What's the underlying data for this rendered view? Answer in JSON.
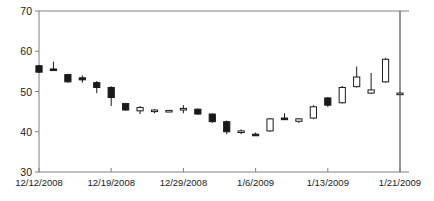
{
  "chart_data": {
    "type": "candlestick",
    "title": "",
    "xlabel": "",
    "ylabel": "",
    "ylim": [
      30,
      70
    ],
    "yticks": [
      30,
      40,
      50,
      60,
      70
    ],
    "ytick_labels": [
      "30",
      "40",
      "50",
      "60",
      "70"
    ],
    "grid": false,
    "legend": null,
    "xtick_labels": [
      "12/12/2008",
      "12/19/2008",
      "12/29/2008",
      "1/6/2009",
      "1/13/2009",
      "1/21/2009"
    ],
    "xtick_indices": [
      0,
      5,
      10,
      15,
      20,
      25
    ],
    "up_color": "#ffffff",
    "down_color": "#1a1a1a",
    "line_color": "#1a1a1a",
    "axis_color": "#808080",
    "candles": [
      {
        "date": "12/12/2008",
        "open": 56.4,
        "high": 56.6,
        "low": 54.6,
        "close": 54.8,
        "dir": "down"
      },
      {
        "date": "12/15/2008",
        "open": 55.6,
        "high": 57.4,
        "low": 55.5,
        "close": 55.5,
        "dir": "down"
      },
      {
        "date": "12/16/2008",
        "open": 54.2,
        "high": 54.4,
        "low": 52.2,
        "close": 52.4,
        "dir": "down"
      },
      {
        "date": "12/17/2008",
        "open": 53.4,
        "high": 54.0,
        "low": 52.2,
        "close": 52.9,
        "dir": "down"
      },
      {
        "date": "12/18/2008",
        "open": 52.2,
        "high": 52.6,
        "low": 49.6,
        "close": 51.0,
        "dir": "down"
      },
      {
        "date": "12/19/2008",
        "open": 51.0,
        "high": 51.3,
        "low": 46.4,
        "close": 48.5,
        "dir": "down"
      },
      {
        "date": "12/22/2008",
        "open": 47.0,
        "high": 47.2,
        "low": 45.2,
        "close": 45.4,
        "dir": "down"
      },
      {
        "date": "12/23/2008",
        "open": 46.0,
        "high": 46.4,
        "low": 44.4,
        "close": 45.2,
        "dir": "up"
      },
      {
        "date": "12/24/2008",
        "open": 45.2,
        "high": 45.6,
        "low": 44.6,
        "close": 45.4,
        "dir": "up"
      },
      {
        "date": "12/26/2008",
        "open": 45.2,
        "high": 45.4,
        "low": 45.0,
        "close": 45.3,
        "dir": "up"
      },
      {
        "date": "12/29/2008",
        "open": 45.4,
        "high": 46.6,
        "low": 44.6,
        "close": 45.8,
        "dir": "up"
      },
      {
        "date": "12/30/2008",
        "open": 45.6,
        "high": 45.8,
        "low": 44.2,
        "close": 44.4,
        "dir": "down"
      },
      {
        "date": "12/31/2008",
        "open": 44.4,
        "high": 44.6,
        "low": 42.2,
        "close": 42.5,
        "dir": "down"
      },
      {
        "date": "1/2/2009",
        "open": 42.5,
        "high": 42.8,
        "low": 39.4,
        "close": 40.0,
        "dir": "down"
      },
      {
        "date": "1/5/2009",
        "open": 40.2,
        "high": 40.6,
        "low": 39.4,
        "close": 40.0,
        "dir": "up"
      },
      {
        "date": "1/6/2009",
        "open": 39.4,
        "high": 39.8,
        "low": 39.0,
        "close": 39.4,
        "dir": "down"
      },
      {
        "date": "1/7/2009",
        "open": 40.2,
        "high": 43.4,
        "low": 40.0,
        "close": 43.2,
        "dir": "up"
      },
      {
        "date": "1/8/2009",
        "open": 43.4,
        "high": 44.6,
        "low": 43.0,
        "close": 43.4,
        "dir": "down"
      },
      {
        "date": "1/9/2009",
        "open": 42.6,
        "high": 43.4,
        "low": 42.2,
        "close": 43.2,
        "dir": "up"
      },
      {
        "date": "1/12/2009",
        "open": 43.4,
        "high": 46.6,
        "low": 43.2,
        "close": 46.2,
        "dir": "up"
      },
      {
        "date": "1/13/2009",
        "open": 48.4,
        "high": 48.6,
        "low": 46.2,
        "close": 46.6,
        "dir": "down"
      },
      {
        "date": "1/14/2009",
        "open": 47.2,
        "high": 51.4,
        "low": 47.0,
        "close": 51.0,
        "dir": "up"
      },
      {
        "date": "1/15/2009",
        "open": 51.2,
        "high": 56.2,
        "low": 51.0,
        "close": 53.6,
        "dir": "up"
      },
      {
        "date": "1/16/2009",
        "open": 49.6,
        "high": 54.6,
        "low": 49.4,
        "close": 50.4,
        "dir": "up"
      },
      {
        "date": "1/20/2009",
        "open": 52.4,
        "high": 58.4,
        "low": 52.2,
        "close": 58.0,
        "dir": "up"
      },
      {
        "date": "1/21/2009",
        "open": 49.6,
        "high": 49.8,
        "low": 49.4,
        "close": 49.6,
        "dir": "up"
      }
    ]
  }
}
